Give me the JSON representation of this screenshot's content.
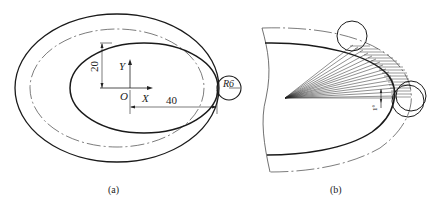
{
  "figure": {
    "panel_a": {
      "caption": "(a)",
      "axis_x_label": "X",
      "axis_y_label": "Y",
      "origin_label": "O",
      "dim_vertical": "20",
      "dim_horizontal": "40",
      "radius_label": "R6"
    },
    "panel_b": {
      "caption": "(b)",
      "angle_label": "1°"
    }
  },
  "colors": {
    "stroke": "#1a1a1a",
    "thin_stroke": "#333333",
    "background": "#ffffff"
  }
}
